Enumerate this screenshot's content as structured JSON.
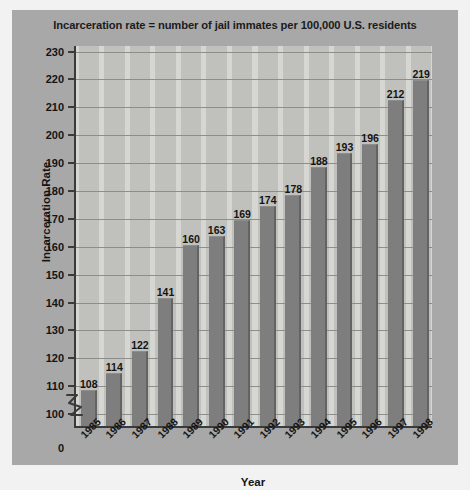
{
  "chart_data": {
    "type": "bar",
    "title": "Incarceration rate = number of jail immates per 100,000 U.S. residents",
    "xlabel": "Year",
    "ylabel": "Incarceration Rate",
    "categories": [
      "1985",
      "1986",
      "1987",
      "1988",
      "1989",
      "1990",
      "1991",
      "1992",
      "1993",
      "1994",
      "1995",
      "1996",
      "1997",
      "1998"
    ],
    "values": [
      108,
      114,
      122,
      141,
      160,
      163,
      169,
      174,
      178,
      188,
      193,
      196,
      212,
      219
    ],
    "ylim": [
      95,
      232
    ],
    "yticks": [
      "230",
      "220",
      "210",
      "200",
      "190",
      "180",
      "170",
      "160",
      "150",
      "140",
      "130",
      "120",
      "110",
      "100",
      "0"
    ],
    "ytick_values": [
      230,
      220,
      210,
      200,
      190,
      180,
      170,
      160,
      150,
      140,
      130,
      120,
      110,
      100,
      0
    ],
    "axis_break": true,
    "axis_break_between": [
      0,
      100
    ],
    "grid": "horizontal",
    "legend": "none",
    "data_labels": [
      "108",
      "114",
      "122",
      "141",
      "160",
      "163",
      "169",
      "174",
      "178",
      "188",
      "193",
      "196",
      "212",
      "219"
    ],
    "colors": {
      "panel": "#a8a8a8",
      "plot_background": "#d6d6d2",
      "band": "#c0c0bc",
      "bar": "#7e7e7e",
      "bar_edge": "#636363",
      "gridline": "#8d8d8a",
      "axis": "#3a3a3a",
      "text": "#141414"
    }
  }
}
